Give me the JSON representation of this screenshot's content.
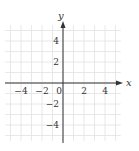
{
  "chart_data": {
    "type": "scatter",
    "title": "",
    "xlabel": "x",
    "ylabel": "y",
    "xlim": [
      -5.5,
      5.5
    ],
    "ylim": [
      -5.5,
      5.5
    ],
    "grid": true,
    "x_ticks": [
      -4,
      -2,
      0,
      2,
      4
    ],
    "y_ticks": [
      -4,
      -2,
      2,
      4
    ],
    "x_tick_labels": [
      "−4",
      "−2",
      "0",
      "2",
      "4"
    ],
    "y_tick_labels": [
      "−4",
      "−2",
      "2",
      "4"
    ],
    "series": [],
    "legend": null
  },
  "colors": {
    "grid": "#e2e2e2",
    "axis": "#333333",
    "text": "#333333"
  }
}
